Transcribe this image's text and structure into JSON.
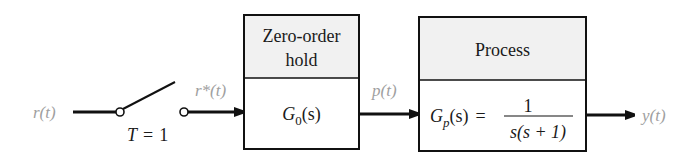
{
  "diagram": {
    "type": "sampled-data block diagram",
    "colors": {
      "line": "#111111",
      "header_fill": "#f1f1f1",
      "body_fill": "#ffffff",
      "signal_label": "#a0a0a0"
    },
    "signals": {
      "input": "r(t)",
      "sampled": "r*(t)",
      "hold_output": "p(t)",
      "output": "y(t)"
    },
    "sampler": {
      "label_T": "T",
      "label_eq": "=",
      "label_val": "1"
    },
    "blocks": [
      {
        "header_line1": "Zero-order",
        "header_line2": "hold",
        "tf_G": "G",
        "tf_sub": "0",
        "tf_arg": "(s)"
      },
      {
        "header": "Process",
        "tf_G": "G",
        "tf_sub": "p",
        "tf_arg": "(s)",
        "tf_eq": "=",
        "numerator": "1",
        "denominator": "s(s + 1)"
      }
    ]
  }
}
